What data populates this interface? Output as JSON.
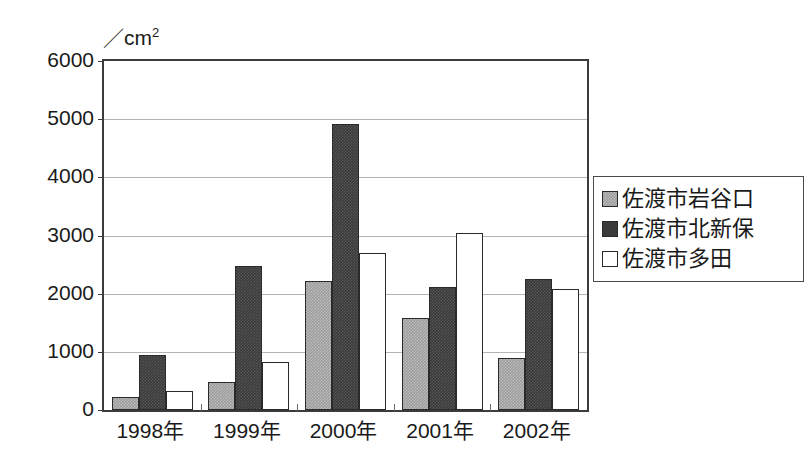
{
  "chart_data": {
    "type": "bar",
    "title": "",
    "xlabel": "",
    "ylabel": "",
    "unit_label": "／cm2",
    "unit_label_parts": {
      "slash": "／",
      "base": "cm",
      "sup": "2"
    },
    "categories": [
      "1998年",
      "1999年",
      "2000年",
      "2001年",
      "2002年"
    ],
    "series": [
      {
        "name": "佐渡市岩谷口",
        "color": "#9d9d9d",
        "values": [
          220,
          490,
          2210,
          1590,
          900
        ]
      },
      {
        "name": "佐渡市北新保",
        "color": "#3a3a3a",
        "values": [
          940,
          2480,
          4910,
          2110,
          2260
        ]
      },
      {
        "name": "佐渡市多田",
        "color": "#ffffff",
        "values": [
          330,
          830,
          2700,
          3050,
          2080
        ]
      }
    ],
    "ylim": [
      0,
      6000
    ],
    "yticks": [
      0,
      1000,
      2000,
      3000,
      4000,
      5000,
      6000
    ],
    "ytick_labels": [
      "0",
      "1000",
      "2000",
      "3000",
      "4000",
      "5000",
      "6000"
    ],
    "grid": true,
    "legend_position": "right"
  },
  "legend": {
    "entries": [
      {
        "label": "佐渡市岩谷口"
      },
      {
        "label": "佐渡市北新保"
      },
      {
        "label": "佐渡市多田"
      }
    ]
  }
}
